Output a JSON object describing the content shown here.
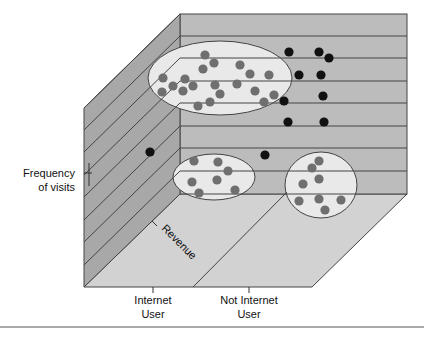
{
  "chart_data": {
    "type": "scatter",
    "title": "",
    "style": "3D box with three axes",
    "axes": {
      "vertical": "Frequency of visits",
      "depth": "Revenue",
      "horizontal": [
        "Internet User",
        "Not Internet User"
      ]
    },
    "colors": {
      "side_panel": "#a8a8a8",
      "back_wall": "#bcbcbc",
      "floor": "#d2d2d2",
      "cluster_fill": "#e9e9e9",
      "cluster_dot": "#6f6f6f",
      "outlier_dot": "#111111",
      "line": "#444444"
    },
    "clusters": [
      {
        "name": "high-frequency cluster",
        "ellipse": {
          "cx": 220,
          "cy": 78,
          "rx": 72,
          "ry": 37
        },
        "points": [
          [
            205,
            55
          ],
          [
            214,
            63
          ],
          [
            203,
            69
          ],
          [
            240,
            65
          ],
          [
            250,
            74
          ],
          [
            269,
            75
          ],
          [
            163,
            78
          ],
          [
            185,
            79
          ],
          [
            173,
            86
          ],
          [
            193,
            86
          ],
          [
            215,
            85
          ],
          [
            237,
            84
          ],
          [
            162,
            92
          ],
          [
            183,
            91
          ],
          [
            220,
            94
          ],
          [
            255,
            91
          ],
          [
            274,
            95
          ],
          [
            264,
            102
          ],
          [
            210,
            102
          ],
          [
            198,
            106
          ]
        ]
      },
      {
        "name": "internet-user low-frequency cluster",
        "ellipse": {
          "cx": 214,
          "cy": 177,
          "rx": 41,
          "ry": 23
        },
        "points": [
          [
            194,
            161
          ],
          [
            218,
            162
          ],
          [
            228,
            171
          ],
          [
            192,
            182
          ],
          [
            217,
            180
          ],
          [
            199,
            193
          ],
          [
            235,
            190
          ]
        ]
      },
      {
        "name": "non-internet-user cluster",
        "ellipse": {
          "cx": 321,
          "cy": 185,
          "rx": 36,
          "ry": 33
        },
        "points": [
          [
            319,
            161
          ],
          [
            312,
            168
          ],
          [
            319,
            179
          ],
          [
            303,
            184
          ],
          [
            299,
            201
          ],
          [
            319,
            199
          ],
          [
            341,
            200
          ],
          [
            325,
            210
          ]
        ]
      }
    ],
    "outliers": [
      [
        289,
        52
      ],
      [
        319,
        52
      ],
      [
        329,
        58
      ],
      [
        299,
        75
      ],
      [
        321,
        75
      ],
      [
        323,
        96
      ],
      [
        284,
        101
      ],
      [
        288,
        122
      ],
      [
        324,
        122
      ],
      [
        265,
        155
      ],
      [
        150,
        152
      ]
    ]
  },
  "labels": {
    "frequency_line1": "Frequency",
    "frequency_line2": "of visits",
    "revenue": "Revenue",
    "internet_line1": "Internet",
    "internet_line2": "User",
    "not_internet_line1": "Not Internet",
    "not_internet_line2": "User"
  }
}
